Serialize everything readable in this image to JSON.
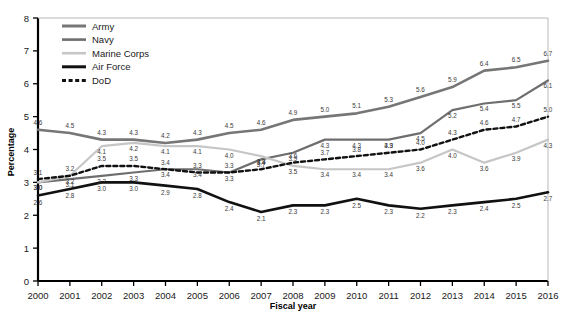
{
  "chart_data": {
    "type": "line",
    "title": "",
    "xlabel": "Fiscal year",
    "ylabel": "Percentage",
    "grid": false,
    "legend_position": "top-left",
    "xlim": [
      2000,
      2016
    ],
    "ylim": [
      0,
      8
    ],
    "yticks": [
      "0",
      "1",
      "2",
      "3",
      "4",
      "5",
      "6",
      "7",
      "8"
    ],
    "categories": [
      "2000",
      "2001",
      "2002",
      "2003",
      "2004",
      "2005",
      "2006",
      "2007",
      "2008",
      "2009",
      "2010",
      "2011",
      "2012",
      "2013",
      "2014",
      "2015",
      "2016"
    ],
    "series": [
      {
        "name": "Army",
        "color": "#767676",
        "width": 2.6,
        "dash": "none",
        "values": [
          4.6,
          4.5,
          4.3,
          4.3,
          4.2,
          4.3,
          4.5,
          4.6,
          4.9,
          5.0,
          5.1,
          5.3,
          5.6,
          5.9,
          6.4,
          6.5,
          6.7
        ]
      },
      {
        "name": "Navy",
        "color": "#6e6e6e",
        "width": 2.2,
        "dash": "none",
        "values": [
          3.0,
          3.1,
          3.2,
          3.3,
          3.4,
          3.4,
          3.3,
          3.7,
          3.9,
          4.3,
          4.3,
          4.3,
          4.5,
          5.2,
          5.4,
          5.5,
          6.1
        ]
      },
      {
        "name": "Marine Corps",
        "color": "#c6c6c6",
        "width": 2.2,
        "dash": "none",
        "values": [
          3.0,
          3.2,
          4.1,
          4.2,
          4.1,
          4.1,
          4.0,
          3.8,
          3.5,
          3.4,
          3.4,
          3.4,
          3.6,
          4.0,
          3.6,
          3.9,
          4.3
        ]
      },
      {
        "name": "Air Force",
        "color": "#111111",
        "width": 2.6,
        "dash": "none",
        "values": [
          2.6,
          2.8,
          3.0,
          3.0,
          2.9,
          2.8,
          2.4,
          2.1,
          2.3,
          2.3,
          2.5,
          2.3,
          2.2,
          2.3,
          2.4,
          2.5,
          2.7
        ]
      },
      {
        "name": "DoD",
        "color": "#111111",
        "width": 2.4,
        "dash": "4,3",
        "values": [
          3.1,
          3.2,
          3.5,
          3.5,
          3.4,
          3.3,
          3.3,
          3.4,
          3.6,
          3.7,
          3.8,
          3.9,
          4.0,
          4.3,
          4.6,
          4.7,
          5.0
        ]
      }
    ],
    "point_labels": {
      "Army": [
        "4.6",
        "4.5",
        "4.3",
        "4.3",
        "4.2",
        "4.3",
        "4.5",
        "4.6",
        "4.9",
        "5.0",
        "5.1",
        "5.3",
        "5.6",
        "5.9",
        "6.4",
        "6.5",
        "6.7"
      ],
      "Navy": [
        "3.0",
        "3.1",
        "3.2",
        "3.3",
        "3.4",
        "3.4",
        "3.3",
        "3.7",
        "3.9",
        "4.3",
        "4.3",
        "4.3",
        "4.5",
        "5.2",
        "5.4",
        "5.5",
        "6.1"
      ],
      "Marine Corps": [
        "3.0",
        "3.2",
        "4.1",
        "4.2",
        "4.1",
        "4.1",
        "4.0",
        "3.8",
        "3.5",
        "3.4",
        "3.4",
        "3.4",
        "3.6",
        "4.0",
        "3.6",
        "3.9",
        "4.3"
      ],
      "Air Force": [
        "2.6",
        "2.8",
        "3.0",
        "3.0",
        "2.9",
        "2.8",
        "2.4",
        "2.1",
        "2.3",
        "2.3",
        "2.5",
        "2.3",
        "2.2",
        "2.3",
        "2.4",
        "2.5",
        "2.7"
      ],
      "DoD": [
        "3.1",
        "3.2",
        "3.5",
        "3.5",
        "3.4",
        "3.3",
        "3.3",
        "3.4",
        "3.6",
        "3.7",
        "3.8",
        "3.9",
        "4.0",
        "4.3",
        "4.6",
        "4.7",
        "5.0"
      ]
    }
  },
  "legend": {
    "items": [
      {
        "label": "Army"
      },
      {
        "label": "Navy"
      },
      {
        "label": "Marine Corps"
      },
      {
        "label": "Air Force"
      },
      {
        "label": "DoD"
      }
    ]
  },
  "axes": {
    "y_title": "Percentage",
    "x_title": "Fiscal year"
  }
}
